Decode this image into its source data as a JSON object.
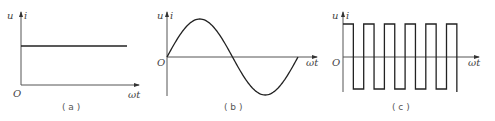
{
  "panels": [
    {
      "id": "a",
      "caption": "( a )",
      "waveform": "dc-constant",
      "y_axis_label_u": "u",
      "y_axis_label_i": "i",
      "x_axis_label": "ωt",
      "origin_label": "O"
    },
    {
      "id": "b",
      "caption": "( b )",
      "waveform": "sine",
      "cycles": 1,
      "y_axis_label_u": "u",
      "y_axis_label_i": "i",
      "x_axis_label": "ωt",
      "origin_label": "O"
    },
    {
      "id": "c",
      "caption": "( c )",
      "waveform": "square",
      "cycles": 6,
      "y_axis_label_u": "u",
      "y_axis_label_i": "i",
      "x_axis_label": "ωt",
      "origin_label": "O"
    }
  ],
  "colors": {
    "curve": "#222222",
    "axis": "#555555",
    "text": "#444444"
  }
}
